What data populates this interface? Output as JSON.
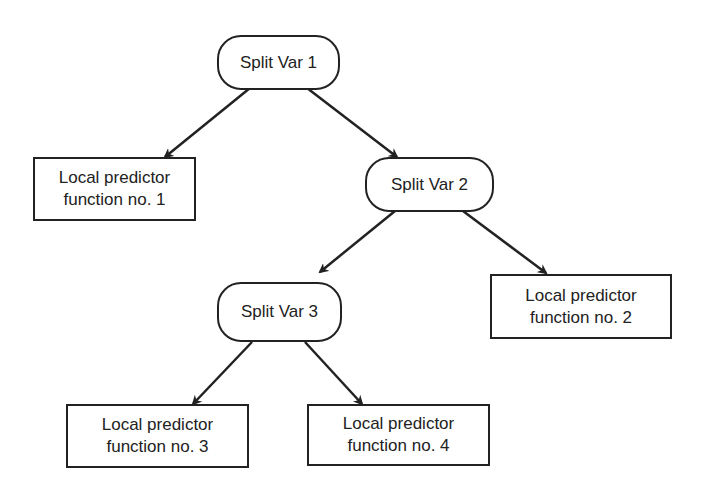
{
  "diagram": {
    "type": "decision-tree",
    "nodes": {
      "split1": {
        "label": "Split Var 1"
      },
      "split2": {
        "label": "Split Var 2"
      },
      "split3": {
        "label": "Split Var 3"
      },
      "leaf1": {
        "line1": "Local predictor",
        "line2": "function no. 1"
      },
      "leaf2": {
        "line1": "Local predictor",
        "line2": "function no. 2"
      },
      "leaf3": {
        "line1": "Local predictor",
        "line2": "function no. 3"
      },
      "leaf4": {
        "line1": "Local predictor",
        "line2": "function no. 4"
      }
    },
    "edges": [
      {
        "from": "split1",
        "to": "leaf1"
      },
      {
        "from": "split1",
        "to": "split2"
      },
      {
        "from": "split2",
        "to": "split3"
      },
      {
        "from": "split2",
        "to": "leaf2"
      },
      {
        "from": "split3",
        "to": "leaf3"
      },
      {
        "from": "split3",
        "to": "leaf4"
      }
    ]
  }
}
